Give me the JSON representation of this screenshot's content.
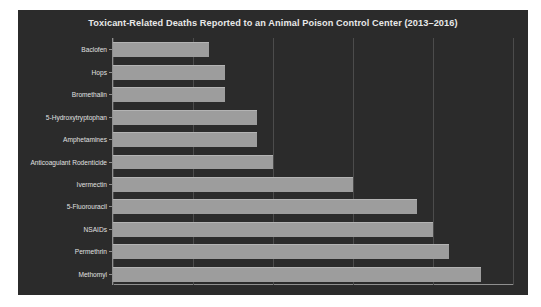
{
  "chart_data": {
    "type": "bar",
    "orientation": "horizontal",
    "title": "Toxicant-Related Deaths Reported to an Animal Poison Control Center (2013–2016)",
    "xlabel": "",
    "ylabel": "",
    "categories": [
      "Baclofen",
      "Hops",
      "Bromethalin",
      "5-Hydroxytryptophan",
      "Amphetamines",
      "Anticoagulant Rodenticide",
      "Ivermectin",
      "5-Fluorouracil",
      "NSAIDs",
      "Permethrin",
      "Methomyl"
    ],
    "values": [
      6,
      7,
      7,
      9,
      9,
      10,
      15,
      19,
      20,
      21,
      23
    ],
    "xlim": [
      0,
      25
    ],
    "xticks": [
      0,
      5,
      10,
      15,
      20,
      25
    ],
    "xtick_labels": [
      "0",
      "5",
      "10",
      "15",
      "20",
      "25"
    ],
    "grid": "vertical",
    "legend": "none",
    "theme": {
      "figure_background": "#2b2b2b",
      "axes_background": "#2b2b2b",
      "bar_color": "#9d9d9d",
      "grid_color": "#4c4c4c",
      "text_color": "#e0e0e0",
      "title_color": "#e8e8e8",
      "spine_color": "#8f8f8f",
      "page_background": "#ffffff"
    }
  }
}
